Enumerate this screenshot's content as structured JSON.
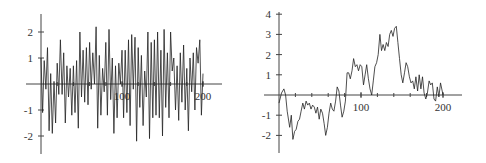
{
  "chart_data": [
    {
      "type": "line",
      "title": "",
      "xlabel": "",
      "ylabel": "",
      "xlim": [
        0,
        200
      ],
      "ylim": [
        -2.5,
        2.5
      ],
      "xticks": [
        100,
        200
      ],
      "xtick_labels": [
        "100",
        "200"
      ],
      "yticks": [
        -2,
        -1,
        1,
        2
      ],
      "ytick_labels": [
        "-2",
        "-1",
        "1",
        "2"
      ],
      "grid": false,
      "legend": "none",
      "series": [
        {
          "name": "white-noise",
          "x": [
            0,
            2,
            4,
            6,
            8,
            10,
            12,
            14,
            16,
            18,
            20,
            22,
            24,
            26,
            28,
            30,
            32,
            34,
            36,
            38,
            40,
            42,
            44,
            46,
            48,
            50,
            52,
            54,
            56,
            58,
            60,
            62,
            64,
            66,
            68,
            70,
            72,
            74,
            76,
            78,
            80,
            82,
            84,
            86,
            88,
            90,
            92,
            94,
            96,
            98,
            100,
            102,
            104,
            106,
            108,
            110,
            112,
            114,
            116,
            118,
            120,
            122,
            124,
            126,
            128,
            130,
            132,
            134,
            136,
            138,
            140,
            142,
            144,
            146,
            148,
            150,
            152,
            154,
            156,
            158,
            160,
            162,
            164,
            166,
            168,
            170,
            172,
            174,
            176,
            178,
            180,
            182,
            184,
            186,
            188,
            190,
            192,
            194,
            196,
            198,
            200
          ],
          "y": [
            1.0,
            -1.1,
            0.9,
            -0.2,
            1.4,
            -1.8,
            0.4,
            -1.9,
            0.1,
            -1.5,
            0.8,
            -0.4,
            1.7,
            -0.4,
            1.2,
            -1.5,
            0.7,
            -0.5,
            0.6,
            -1.2,
            0.7,
            -1.1,
            0.9,
            -1.7,
            2.0,
            -0.5,
            1.3,
            -0.7,
            1.4,
            -0.8,
            1.6,
            -0.2,
            1.2,
            0.0,
            2.2,
            -1.7,
            1.1,
            -1.2,
            0.6,
            -0.3,
            1.6,
            -1.2,
            2.1,
            -0.6,
            1.0,
            -1.9,
            0.7,
            -1.3,
            0.8,
            0.0,
            1.3,
            -1.3,
            1.3,
            -1.1,
            1.7,
            -1.6,
            1.9,
            -0.2,
            1.8,
            -2.2,
            1.4,
            -0.9,
            1.1,
            -1.6,
            0.5,
            -0.5,
            2.0,
            -2.1,
            1.6,
            -1.3,
            1.7,
            -1.2,
            2.0,
            -1.3,
            1.3,
            -2.0,
            2.1,
            -0.9,
            1.2,
            -1.3,
            2.0,
            0.5,
            1.0,
            -1.0,
            0.7,
            -1.4,
            1.2,
            -0.7,
            1.5,
            -1.0,
            0.6,
            -1.8,
            1.0,
            -0.3,
            1.2,
            -1.0,
            1.4,
            0.8,
            1.7,
            -1.2,
            0.4
          ]
        }
      ]
    },
    {
      "type": "line",
      "title": "",
      "xlabel": "",
      "ylabel": "",
      "xlim": [
        0,
        200
      ],
      "ylim": [
        -3,
        4
      ],
      "xticks": [
        100,
        200
      ],
      "xtick_labels": [
        "100",
        "200"
      ],
      "yticks": [
        -2,
        -1,
        1,
        2,
        3,
        4
      ],
      "ytick_labels": [
        "-2",
        "-1",
        "1",
        "2",
        "3",
        "4"
      ],
      "grid": false,
      "legend": "none",
      "series": [
        {
          "name": "random-walk",
          "x": [
            0,
            3,
            6,
            8,
            10,
            13,
            15,
            17,
            19,
            21,
            23,
            25,
            27,
            29,
            31,
            33,
            35,
            37,
            39,
            41,
            43,
            45,
            47,
            49,
            51,
            53,
            55,
            57,
            59,
            61,
            63,
            65,
            67,
            69,
            71,
            73,
            75,
            77,
            79,
            81,
            83,
            85,
            87,
            89,
            91,
            93,
            95,
            97,
            99,
            101,
            103,
            105,
            107,
            109,
            111,
            113,
            115,
            117,
            119,
            121,
            123,
            125,
            127,
            129,
            131,
            133,
            135,
            137,
            139,
            141,
            143,
            145,
            147,
            149,
            151,
            153,
            155,
            157,
            159,
            161,
            163,
            165,
            167,
            169,
            171,
            173,
            175,
            177,
            179,
            181,
            183,
            185,
            187,
            189,
            191,
            193,
            195,
            197,
            199,
            200
          ],
          "y": [
            -0.4,
            0.1,
            0.3,
            0.0,
            -0.8,
            -1.6,
            -1.0,
            -2.2,
            -1.8,
            -1.7,
            -1.3,
            -1.2,
            -0.8,
            -0.4,
            -0.7,
            -0.3,
            -0.5,
            -0.4,
            -0.7,
            -0.5,
            -0.6,
            -0.9,
            -0.6,
            -1.2,
            -0.7,
            -0.9,
            -1.4,
            -2.0,
            -1.6,
            -0.9,
            -0.4,
            -0.7,
            -0.8,
            -0.3,
            0.4,
            0.2,
            -0.5,
            -1.1,
            -0.8,
            -0.3,
            1.1,
            1.1,
            0.8,
            1.2,
            1.8,
            1.4,
            1.5,
            1.2,
            1.5,
            1.4,
            0.5,
            1.0,
            1.5,
            0.8,
            0.3,
            0.0,
            0.7,
            1.4,
            1.6,
            2.0,
            3.0,
            2.2,
            2.5,
            2.2,
            2.6,
            2.4,
            3.0,
            3.2,
            2.9,
            3.3,
            3.4,
            2.6,
            1.8,
            1.0,
            0.6,
            1.1,
            1.6,
            1.4,
            0.9,
            0.6,
            0.7,
            0.3,
            0.9,
            0.2,
            1.0,
            0.3,
            0.9,
            0.1,
            -0.2,
            0.1,
            0.7,
            0.5,
            0.6,
            -0.2,
            -0.3,
            0.4,
            -0.1,
            0.6,
            0.2,
            0.0
          ]
        }
      ]
    }
  ]
}
